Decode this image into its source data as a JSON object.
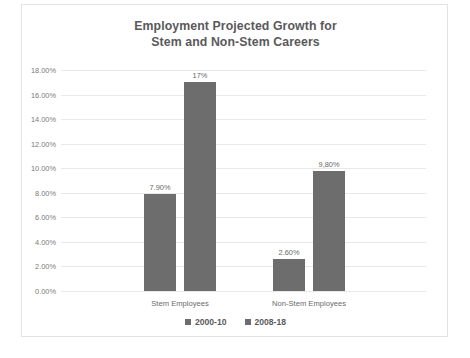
{
  "chart_data": {
    "type": "bar",
    "title": "Employment Projected Growth for Stem and Non-Stem Careers",
    "title_lines": [
      "Employment Projected Growth for",
      "Stem and Non-Stem Careers"
    ],
    "xlabel": "",
    "ylabel": "",
    "categories": [
      "Stem Employees",
      "Non-Stem Employees"
    ],
    "series": [
      {
        "name": "2000-10",
        "values": [
          7.9,
          2.6
        ],
        "labels": [
          "7.90%",
          "2.60%"
        ],
        "color": "#6d6d6d"
      },
      {
        "name": "2008-18",
        "values": [
          17.0,
          9.8
        ],
        "labels": [
          "17%",
          "9,80%"
        ],
        "color": "#6d6d6d"
      }
    ],
    "ylim": [
      0,
      18
    ],
    "ytick_values": [
      0,
      2,
      4,
      6,
      8,
      10,
      12,
      14,
      16,
      18
    ],
    "ytick_labels": [
      "0.00%",
      "2.00%",
      "4.00%",
      "6.00%",
      "8.00%",
      "10.00%",
      "12.00%",
      "14.00%",
      "16.00%",
      "18.00%"
    ],
    "grid": true,
    "grid_axis": "y",
    "legend_position": "bottom",
    "legend_entries": [
      "2000-10",
      "2008-18"
    ]
  },
  "style": {
    "bar_color": "#6d6d6d",
    "grid_color": "#e8e8e8",
    "title_color": "#59595b",
    "tick_color": "#7a7a7a",
    "border_color": "#e2e2e2",
    "background": "#ffffff"
  }
}
